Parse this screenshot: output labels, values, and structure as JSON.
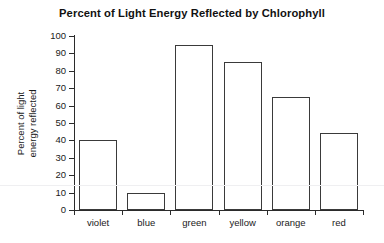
{
  "chart_data": {
    "type": "bar",
    "title": "Percent of Light Energy Reflected by Chlorophyll",
    "xlabel": "",
    "ylabel": "Percent of light energy reflected",
    "ylabel_lines": [
      "Percent of light",
      "energy reflected"
    ],
    "categories": [
      "violet",
      "blue",
      "green",
      "yellow",
      "orange",
      "red"
    ],
    "values": [
      40,
      10,
      95,
      85,
      65,
      44
    ],
    "ylim": [
      0,
      100
    ],
    "ytick_step": 10,
    "yticks": [
      0,
      10,
      20,
      30,
      40,
      50,
      60,
      70,
      80,
      90,
      100
    ],
    "ytick_labels": [
      "0",
      "10",
      "20",
      "30",
      "40",
      "50",
      "60",
      "70",
      "80",
      "90",
      "100"
    ],
    "grid": false,
    "legend": false,
    "bar_fill": "#ffffff",
    "bar_outline": "#3a3a3a",
    "axis_color": "#2b2b2b",
    "background": "#ffffff"
  }
}
